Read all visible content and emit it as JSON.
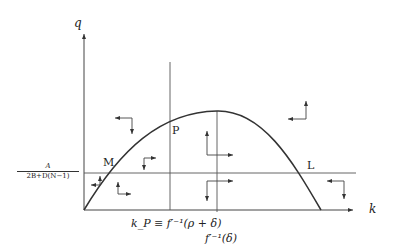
{
  "diagram": {
    "type": "phase-diagram",
    "axes": {
      "y_label": "q",
      "x_label": "k"
    },
    "horizontal_line_label": {
      "numerator": "A",
      "denominator": "2B+D(N−1)"
    },
    "vertical_lines": [
      {
        "label": "k_P ≡ f′⁻¹(ρ + δ)"
      },
      {
        "label": "f′⁻¹(δ)"
      }
    ],
    "points": [
      {
        "label": "M"
      },
      {
        "label": "P"
      },
      {
        "label": "L"
      }
    ],
    "curve": "inverted parabola q(k) from origin to L",
    "colors": {
      "line": "#333333",
      "background": "#ffffff"
    }
  }
}
